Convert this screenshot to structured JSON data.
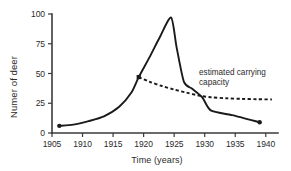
{
  "chart_data": {
    "type": "line",
    "title": "",
    "xlabel": "Time (years)",
    "ylabel": "Numer of deer",
    "xlim": [
      1905,
      1942
    ],
    "ylim": [
      0,
      100
    ],
    "grid": false,
    "legend_position": "none",
    "xticks": [
      1905,
      1910,
      1915,
      1920,
      1925,
      1930,
      1935,
      1940
    ],
    "xtick_labels": [
      "1905",
      "1910",
      "1915",
      "1920",
      "1925",
      "1930",
      "1935",
      "1940"
    ],
    "yticks": [
      0,
      25,
      50,
      75,
      100
    ],
    "ytick_labels": [
      "0",
      "25",
      "50",
      "75",
      "100"
    ],
    "annotations": [
      {
        "name": "estimated-carrying-capacity",
        "lines": [
          "estimated carrying",
          "capacity"
        ],
        "x": 1934.5,
        "y": 43
      }
    ],
    "series": [
      {
        "name": "deer population",
        "style": "solid",
        "color": "#1a1a1a",
        "x": [
          1906.2,
          1908.5,
          1911.0,
          1913.5,
          1916.0,
          1918.0,
          1919.2,
          1921.0,
          1922.6,
          1924.5,
          1925.4,
          1926.6,
          1928.0,
          1929.6,
          1931.0,
          1934.5,
          1939.0
        ],
        "values": [
          6,
          7,
          10,
          14,
          22,
          34,
          47,
          64,
          80,
          97,
          72,
          43,
          37,
          30,
          19,
          15,
          9
        ],
        "markers": [
          {
            "x": 1906.2,
            "y": 6,
            "shape": "dot"
          },
          {
            "x": 1919.2,
            "y": 47,
            "shape": "square"
          },
          {
            "x": 1939.0,
            "y": 9,
            "shape": "dot"
          }
        ]
      },
      {
        "name": "estimated carrying capacity",
        "style": "dashed",
        "color": "#1a1a1a",
        "x": [
          1919.2,
          1921.0,
          1923.0,
          1925.0,
          1927.0,
          1929.0,
          1931.0,
          1933.5,
          1936.0,
          1938.5,
          1941.0
        ],
        "values": [
          47,
          43,
          39.5,
          36.5,
          34,
          31.5,
          30,
          29.2,
          28.7,
          28.4,
          28.2
        ]
      }
    ]
  }
}
